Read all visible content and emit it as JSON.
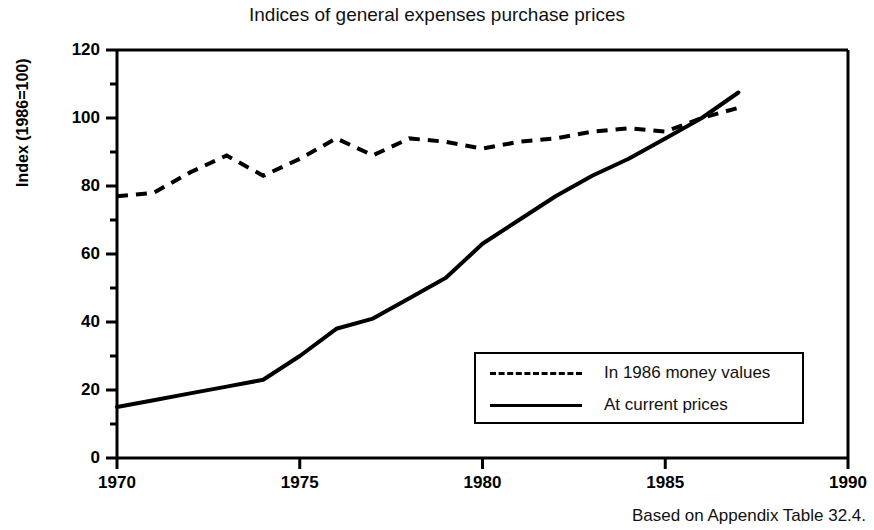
{
  "chart_data": {
    "type": "line",
    "title": "Indices of general expenses purchase prices",
    "xlabel": "",
    "ylabel": "Index (1986=100)",
    "caption": "Based on Appendix Table 32.4.",
    "xlim": [
      1970,
      1990
    ],
    "ylim": [
      0,
      120
    ],
    "xticks": [
      1970,
      1975,
      1980,
      1985,
      1990
    ],
    "yticks": [
      0,
      20,
      40,
      60,
      80,
      100,
      120
    ],
    "yminorticks": [
      10,
      30,
      50,
      70,
      90,
      110
    ],
    "grid": false,
    "legend_position": "lower right",
    "x": [
      1970,
      1971,
      1972,
      1973,
      1974,
      1975,
      1976,
      1977,
      1978,
      1979,
      1980,
      1981,
      1982,
      1983,
      1984,
      1985,
      1986,
      1987
    ],
    "series": [
      {
        "name": "In 1986 money values",
        "style": "dashed",
        "color": "#000000",
        "values": [
          77,
          78,
          84,
          89,
          83,
          88,
          94,
          89,
          94,
          93,
          91,
          93,
          94,
          96,
          97,
          96,
          100,
          103
        ]
      },
      {
        "name": "At current prices",
        "style": "solid",
        "color": "#000000",
        "values": [
          15,
          17,
          19,
          21,
          23,
          30,
          38,
          41,
          47,
          53,
          63,
          70,
          77,
          83,
          88,
          94,
          100,
          107.5
        ]
      }
    ]
  },
  "axes": {
    "y_tick_labels": [
      "0",
      "20",
      "40",
      "60",
      "80",
      "100",
      "120"
    ],
    "x_tick_labels": [
      "1970",
      "1975",
      "1980",
      "1985",
      "1990"
    ]
  },
  "legend": {
    "items": [
      {
        "label": "In 1986 money values",
        "style": "dashed"
      },
      {
        "label": "At current prices",
        "style": "solid"
      }
    ]
  },
  "colors": {
    "ink": "#000000",
    "background": "#ffffff"
  }
}
